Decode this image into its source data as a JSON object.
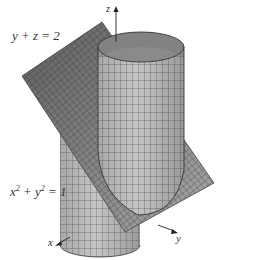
{
  "figure": {
    "plane_equation": "y + z = 2",
    "cylinder_equation_base": "x",
    "cylinder_equation_mid": " + y",
    "cylinder_equation_end": " = 1",
    "exponent": "2",
    "axes": {
      "x": "x",
      "y": "y",
      "z": "z"
    },
    "colors": {
      "plane_dark": "#6e6e6e",
      "plane_light": "#9a9a9a",
      "cylinder": "#b8b8b8",
      "cylinder_inner": "#8c8c8c",
      "grid": "#2a2a2a",
      "axis": "#222222"
    }
  }
}
